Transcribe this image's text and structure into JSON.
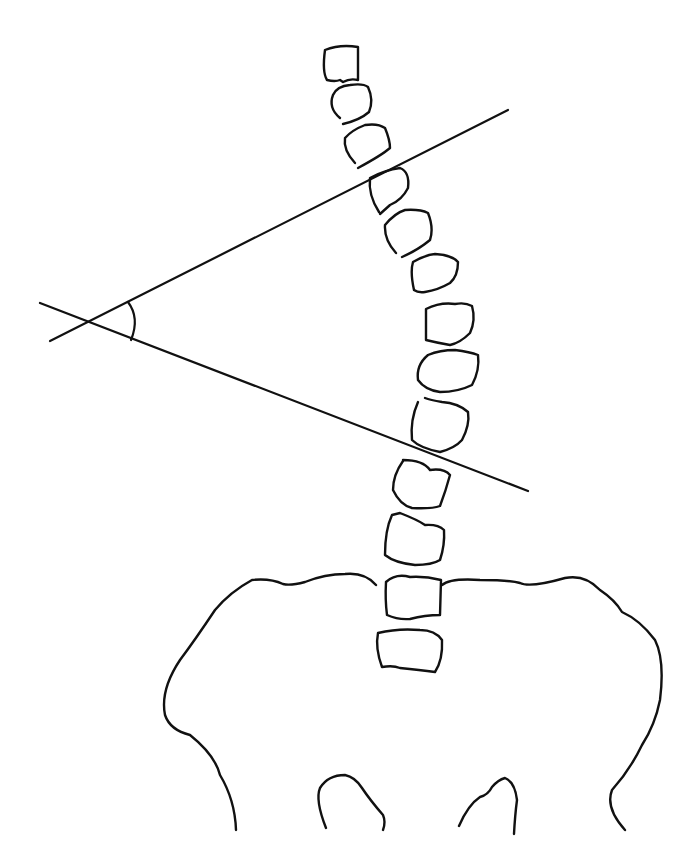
{
  "diagram": {
    "background": "#ffffff",
    "stroke_color": "#111111",
    "elements": {
      "vertebrae_count": 14,
      "upper_endplate_line": {
        "x1": 50,
        "y1": 341,
        "x2": 508,
        "y2": 110
      },
      "lower_endplate_line": {
        "x1": 40,
        "y1": 303,
        "x2": 528,
        "y2": 491
      },
      "angle_arc": {
        "center": [
          88,
          322
        ],
        "label": ""
      },
      "pelvis": "iliac crests with sacrum"
    }
  }
}
